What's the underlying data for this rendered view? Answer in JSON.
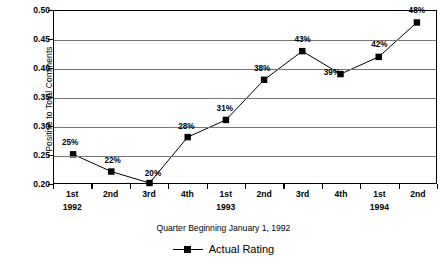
{
  "chart_data": {
    "type": "line",
    "title": "",
    "xlabel": "Quarter Beginning January 1, 1992",
    "ylabel": "Positive to Total Comments",
    "categories": [
      "1st",
      "2nd",
      "3rd",
      "4th",
      "1st",
      "2nd",
      "3rd",
      "4th",
      "1st",
      "2nd"
    ],
    "group_labels": [
      {
        "text": "1992",
        "index": 0
      },
      {
        "text": "1993",
        "index": 4
      },
      {
        "text": "1994",
        "index": 8
      }
    ],
    "series": [
      {
        "name": "Actual Rating",
        "values": [
          0.25,
          0.22,
          0.2,
          0.28,
          0.31,
          0.38,
          0.43,
          0.39,
          0.42,
          0.48
        ],
        "data_labels": [
          "25%",
          "22%",
          "20%",
          "28%",
          "31%",
          "38%",
          "43%",
          "39%",
          "42%",
          "48%"
        ],
        "color": "#000000",
        "marker": "square"
      }
    ],
    "ylim": [
      0.2,
      0.5
    ],
    "yticks": [
      0.5,
      0.45,
      0.4,
      0.35,
      0.3,
      0.25,
      0.2
    ],
    "ytick_labels": [
      "0.50",
      "0.45",
      "0.40",
      "0.35",
      "0.30",
      "0.25",
      "0.20"
    ],
    "grid": true,
    "grid_axis": "y",
    "legend_position": "bottom"
  },
  "legend": {
    "items": [
      {
        "label": "Actual Rating"
      }
    ]
  },
  "axes": {
    "x_title": "Quarter Beginning January 1, 1992",
    "y_title": "Positive to Total Comments"
  }
}
